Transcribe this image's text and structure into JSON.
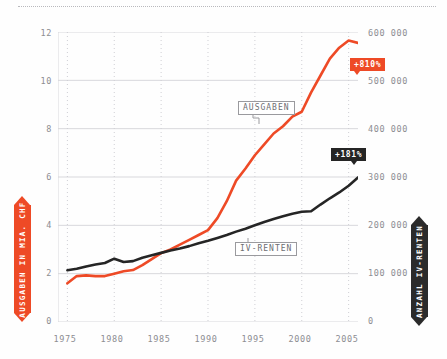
{
  "figure": {
    "axis_label_left": "AUSGABEN IN MIA. CHF",
    "axis_label_right": "ANZAHL IV-RENTEN",
    "series_label_expenses": "AUSGABEN",
    "series_label_pensions": "IV-RENTEN",
    "badge_expenses": "+810%",
    "badge_pensions": "+181%"
  },
  "colors": {
    "expenses": "#ee4a26",
    "pensions": "#252525",
    "grid": "#d8d8dc",
    "grid_dotted": "#cfcfd4",
    "tick_text": "#8d8d92"
  },
  "chart_data": {
    "type": "line",
    "title": "",
    "subtitle": "",
    "xlabel": "",
    "ylabel": "AUSGABEN IN MIA. CHF",
    "ylabel_right": "ANZAHL IV-RENTEN",
    "grid": true,
    "legend": "inline-callouts",
    "xlim": [
      1974,
      2006
    ],
    "ylim": [
      0,
      12
    ],
    "ylim_right": [
      0,
      600000
    ],
    "xticks": [
      1975,
      1980,
      1985,
      1990,
      1995,
      2000,
      2005
    ],
    "xticklabels": [
      "1975",
      "1980",
      "1985",
      "1990",
      "1995",
      "2000",
      "2005"
    ],
    "yticks_left": [
      0,
      2,
      4,
      6,
      8,
      10,
      12
    ],
    "yticklabels_left": [
      "0",
      "2",
      "4",
      "6",
      "8",
      "10",
      "12"
    ],
    "yticks_right": [
      0,
      100000,
      200000,
      300000,
      400000,
      500000,
      600000
    ],
    "yticklabels_right": [
      "0",
      "100 000",
      "200 000",
      "300 000",
      "400 000",
      "500 000",
      "600 000"
    ],
    "x": [
      1975,
      1976,
      1977,
      1978,
      1979,
      1980,
      1981,
      1982,
      1983,
      1984,
      1985,
      1986,
      1987,
      1988,
      1989,
      1990,
      1991,
      1992,
      1993,
      1994,
      1995,
      1996,
      1997,
      1998,
      1999,
      2000,
      2001,
      2002,
      2003,
      2004,
      2005,
      2006
    ],
    "series": [
      {
        "name": "AUSGABEN",
        "axis": "left",
        "unit": "Mia. CHF",
        "color": "#ee4a26",
        "annotation": "+810%",
        "values": [
          1.6,
          1.9,
          1.93,
          1.9,
          1.9,
          2.0,
          2.1,
          2.15,
          2.35,
          2.6,
          2.85,
          3.0,
          3.2,
          3.4,
          3.6,
          3.8,
          4.3,
          5.0,
          5.85,
          6.35,
          6.9,
          7.35,
          7.8,
          8.1,
          8.5,
          8.7,
          9.5,
          10.2,
          10.9,
          11.35,
          11.65,
          11.55
        ]
      },
      {
        "name": "IV-RENTEN",
        "axis": "right",
        "unit": "Anzahl",
        "color": "#252525",
        "annotation": "+181%",
        "values": [
          107000,
          110000,
          115000,
          119000,
          122000,
          131000,
          124000,
          126000,
          133000,
          138000,
          143000,
          148000,
          152000,
          157000,
          163000,
          168000,
          174000,
          180000,
          187000,
          193000,
          200000,
          207000,
          213000,
          219000,
          224000,
          228000,
          229000,
          243000,
          256000,
          268000,
          282000,
          299000
        ]
      }
    ]
  }
}
